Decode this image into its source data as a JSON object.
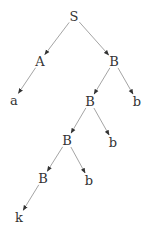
{
  "diagram": {
    "type": "parse-tree",
    "nodes": [
      {
        "id": "n0",
        "label": "S",
        "x": 74,
        "y": 16
      },
      {
        "id": "n1",
        "label": "A",
        "x": 40,
        "y": 61
      },
      {
        "id": "n2",
        "label": "B",
        "x": 114,
        "y": 61
      },
      {
        "id": "n3",
        "label": "a",
        "x": 14,
        "y": 100
      },
      {
        "id": "n4",
        "label": "B",
        "x": 90,
        "y": 101
      },
      {
        "id": "n5",
        "label": "b",
        "x": 137,
        "y": 101
      },
      {
        "id": "n6",
        "label": "B",
        "x": 67,
        "y": 140
      },
      {
        "id": "n7",
        "label": "b",
        "x": 113,
        "y": 142
      },
      {
        "id": "n8",
        "label": "B",
        "x": 43,
        "y": 178
      },
      {
        "id": "n9",
        "label": "b",
        "x": 89,
        "y": 180
      },
      {
        "id": "n10",
        "label": "k",
        "x": 19,
        "y": 217
      }
    ],
    "edges": [
      {
        "from": "n0",
        "to": "n1"
      },
      {
        "from": "n0",
        "to": "n2"
      },
      {
        "from": "n1",
        "to": "n3"
      },
      {
        "from": "n2",
        "to": "n4"
      },
      {
        "from": "n2",
        "to": "n5"
      },
      {
        "from": "n4",
        "to": "n6"
      },
      {
        "from": "n4",
        "to": "n7"
      },
      {
        "from": "n6",
        "to": "n8"
      },
      {
        "from": "n6",
        "to": "n9"
      },
      {
        "from": "n8",
        "to": "n10"
      }
    ],
    "colors": {
      "edge": "#9a9a9a",
      "arrowhead": "#333333",
      "text": "#333333"
    }
  }
}
